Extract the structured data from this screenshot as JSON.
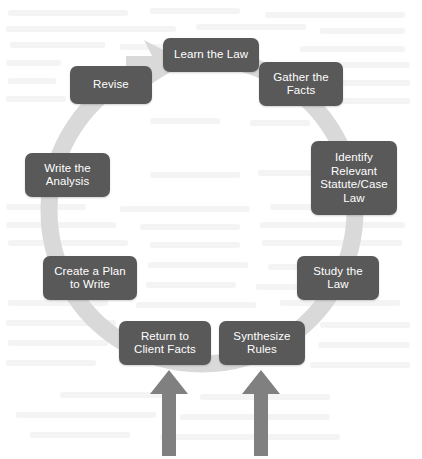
{
  "diagram": {
    "type": "circular-process-cycle",
    "direction": "clockwise",
    "colors": {
      "box_fill": "#595959",
      "box_text": "#ffffff",
      "ring": "#d9d9d9",
      "arrow": "#808080",
      "background": "#ffffff"
    },
    "steps": [
      {
        "id": "learn-the-law",
        "label": "Learn the Law",
        "order": 1,
        "angle_deg": 0,
        "lines": 1
      },
      {
        "id": "gather-the-facts",
        "label": "Gather the\nFacts",
        "order": 2,
        "angle_deg": 45,
        "lines": 2
      },
      {
        "id": "identify-relevant-statute-case-law",
        "label": "Identify\nRelevant\nStatute/Case\nLaw",
        "order": 3,
        "angle_deg": 90,
        "lines": 4
      },
      {
        "id": "study-the-law",
        "label": "Study the\nLaw",
        "order": 4,
        "angle_deg": 135,
        "lines": 2
      },
      {
        "id": "synthesize-rules",
        "label": "Synthesize\nRules",
        "order": 5,
        "angle_deg": 170,
        "lines": 2
      },
      {
        "id": "return-to-client-facts",
        "label": "Return to\nClient Facts",
        "order": 6,
        "angle_deg": 190,
        "lines": 2
      },
      {
        "id": "create-a-plan-to-write",
        "label": "Create a Plan\nto Write",
        "order": 7,
        "angle_deg": 225,
        "lines": 2
      },
      {
        "id": "write-the-analysis",
        "label": "Write the\nAnalysis",
        "order": 8,
        "angle_deg": 270,
        "lines": 2
      },
      {
        "id": "revise",
        "label": "Revise",
        "order": 9,
        "angle_deg": 315,
        "lines": 1
      }
    ],
    "input_arrows": [
      {
        "id": "input-arrow-left",
        "points_to": "return-to-client-facts",
        "direction": "up"
      },
      {
        "id": "input-arrow-right",
        "points_to": "synthesize-rules",
        "direction": "up"
      }
    ],
    "ring_arrowhead": {
      "id": "cycle-arrowhead",
      "points_to": "learn-the-law",
      "position": "top-left"
    }
  }
}
